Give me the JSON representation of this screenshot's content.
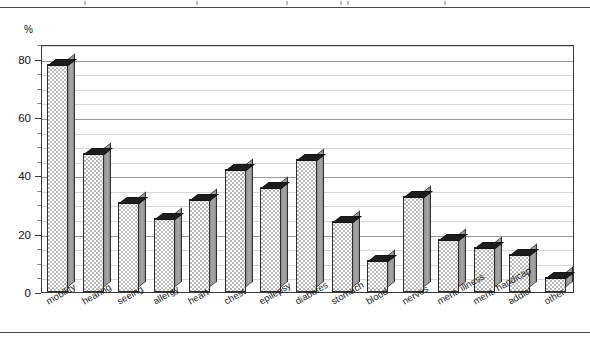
{
  "axis": {
    "unit_label": "%",
    "y_ticks": [
      0,
      20,
      40,
      60,
      80
    ],
    "y_minor_step": 5
  },
  "chart_data": {
    "type": "bar",
    "title": "",
    "subtitle": "",
    "xlabel": "",
    "ylabel": "%",
    "ylim": [
      0,
      85
    ],
    "grid": true,
    "legend": "none",
    "categories": [
      "mobility",
      "hearing",
      "seeing",
      "allergy",
      "heart",
      "chest",
      "epilepsy",
      "diabetes",
      "stomach",
      "blood",
      "nerves",
      "ment. illness",
      "ment. handicap",
      "addict",
      "other"
    ],
    "values": [
      78,
      47.5,
      31,
      25.5,
      32,
      42,
      36,
      45.5,
      24.5,
      11,
      33,
      18,
      15.5,
      13,
      5
    ],
    "tick_labels_y": [
      "0",
      "20",
      "40",
      "60",
      "80"
    ]
  }
}
